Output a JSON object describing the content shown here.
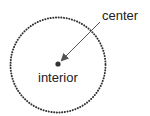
{
  "diagram": {
    "labels": {
      "center": "center",
      "interior": "interior"
    },
    "circle": {
      "cx": 58,
      "cy": 65,
      "r": 48,
      "style": "dotted",
      "color": "#333333"
    },
    "center_point": {
      "x": 58,
      "y": 64,
      "color": "#333333"
    },
    "arrow": {
      "from": [
        100,
        22
      ],
      "to": [
        61,
        61
      ],
      "color": "#555555"
    }
  }
}
